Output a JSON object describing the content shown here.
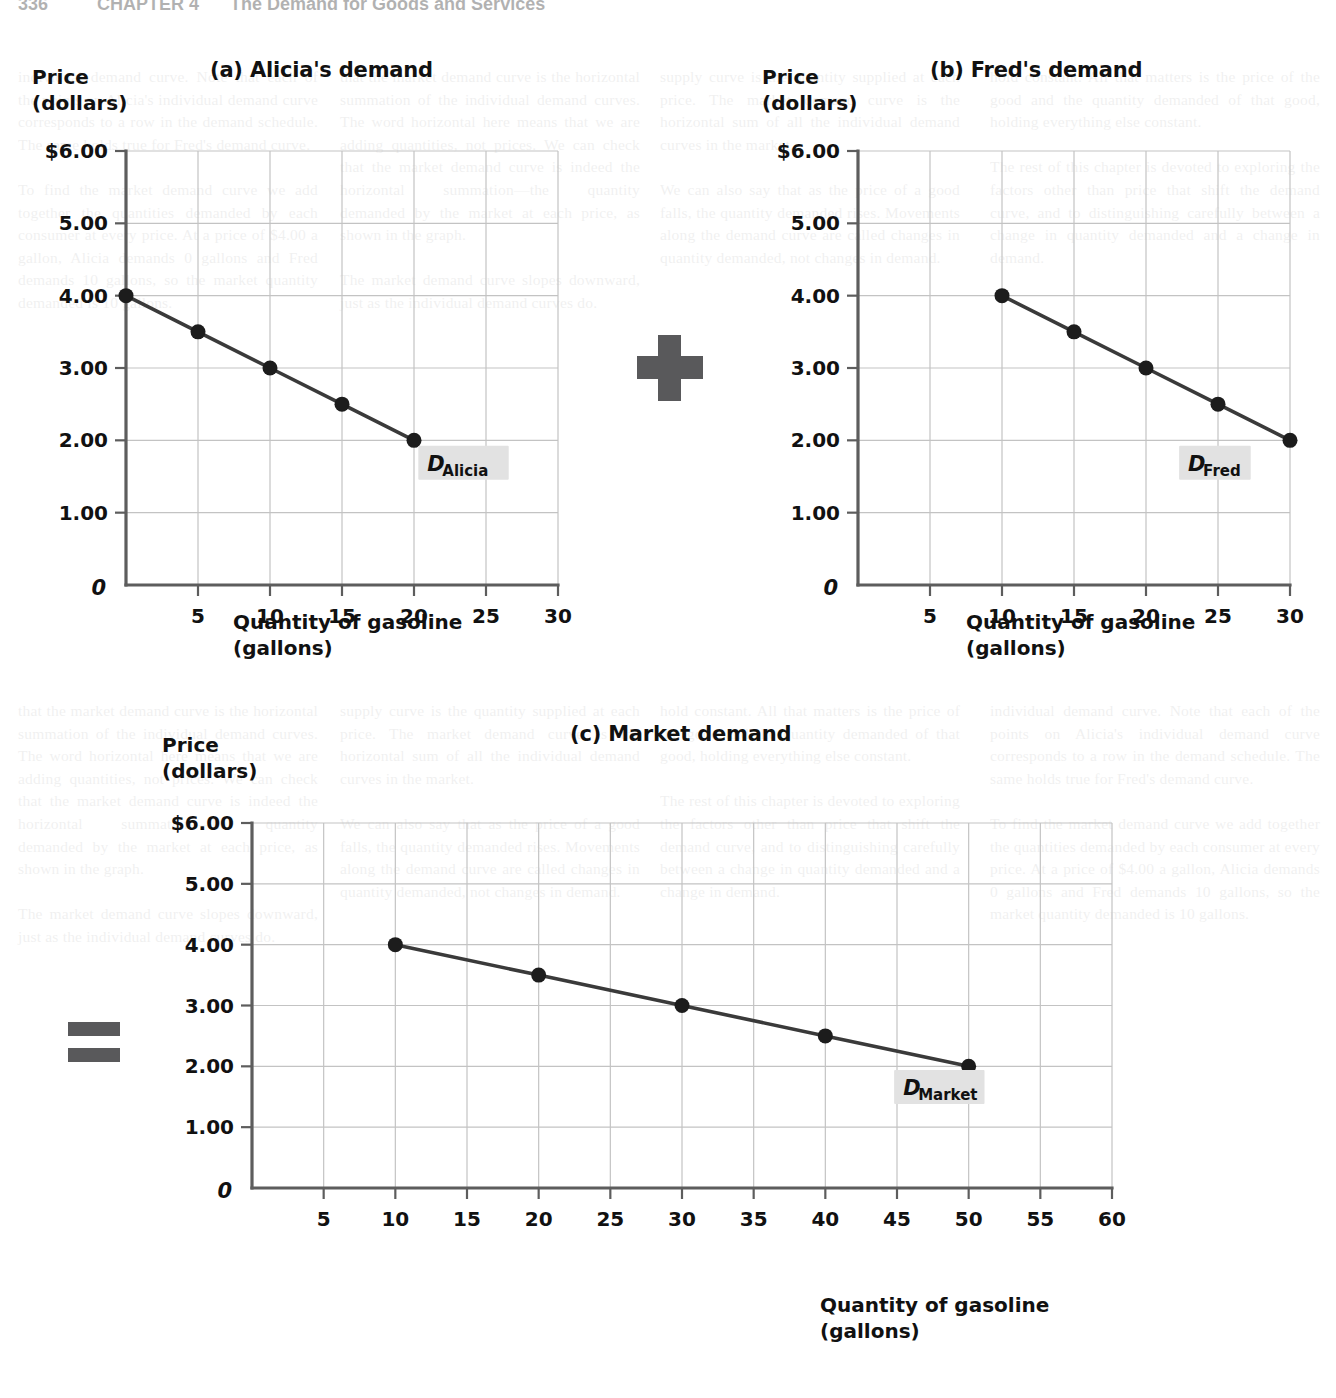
{
  "page": {
    "running_head": {
      "folio": "336",
      "chapter": "CHAPTER 4",
      "title": "The Demand for Goods and Services"
    },
    "background_text": {
      "col1": "individual demand curve. Note that each of the points on Alicia's individual demand curve corresponds to a row in the demand schedule. The same holds true for Fred's demand curve.\n\nTo find the market demand curve we add together the quantities demanded by each consumer at every price. At a price of $4.00 a gallon, Alicia demands 0 gallons and Fred demands 10 gallons, so the market quantity demanded is 10 gallons.",
      "col2": "that the market demand curve is the horizontal summation of the individual demand curves. The word horizontal here means that we are adding quantities, not prices. We can check that the market demand curve is indeed the horizontal summation—the quantity demanded by the market at each price, as shown in the graph.\n\nThe market demand curve slopes downward, just as the individual demand curves do.",
      "col3": "supply curve is the quantity supplied at each price. The market demand curve is the horizontal sum of all the individual demand curves in the market.\n\nWe can also say that as the price of a good falls, the quantity demanded rises. Movements along the demand curve are called changes in quantity demanded, not changes in demand.",
      "col4": "hold constant. All that matters is the price of the good and the quantity demanded of that good, holding everything else constant.\n\nThe rest of this chapter is devoted to exploring the factors other than price that shift the demand curve, and to distinguishing carefully between a change in quantity demanded and a change in demand."
    },
    "operators": {
      "plus": "+",
      "equals": "="
    }
  },
  "charts": {
    "y_axis_caption_line1": "Price",
    "y_axis_caption_line2": "(dollars)",
    "x_axis_caption_line1": "Quantity of gasoline",
    "x_axis_caption_line2": "(gallons)",
    "origin_label": "0",
    "y_tick_labels": [
      "$6.00",
      "5.00",
      "4.00",
      "3.00",
      "2.00",
      "1.00"
    ]
  },
  "chart_data": [
    {
      "id": "alicia",
      "type": "line",
      "title": "(a) Alicia's demand",
      "xlabel": "Quantity of gasoline (gallons)",
      "ylabel": "Price (dollars)",
      "series_label_d": "D",
      "series_label_sub": "Alicia",
      "x": [
        0,
        5,
        10,
        15,
        20
      ],
      "values": [
        4.0,
        3.5,
        3.0,
        2.5,
        2.0
      ],
      "xlim": [
        0,
        30
      ],
      "ylim": [
        0,
        6
      ],
      "xticks": [
        5,
        10,
        15,
        20,
        25,
        30
      ],
      "xtick_labels": [
        "5",
        "10",
        "15",
        "20",
        "25",
        "30"
      ],
      "yticks": [
        1,
        2,
        3,
        4,
        5,
        6
      ],
      "ytick_labels": [
        "1.00",
        "2.00",
        "3.00",
        "4.00",
        "5.00",
        "$6.00"
      ],
      "grid": true,
      "legend": "inline-curve-label"
    },
    {
      "id": "fred",
      "type": "line",
      "title": "(b) Fred's demand",
      "xlabel": "Quantity of gasoline (gallons)",
      "ylabel": "Price (dollars)",
      "series_label_d": "D",
      "series_label_sub": "Fred",
      "x": [
        10,
        15,
        20,
        25,
        30
      ],
      "values": [
        4.0,
        3.5,
        3.0,
        2.5,
        2.0
      ],
      "xlim": [
        0,
        30
      ],
      "ylim": [
        0,
        6
      ],
      "xticks": [
        5,
        10,
        15,
        20,
        25,
        30
      ],
      "xtick_labels": [
        "5",
        "10",
        "15",
        "20",
        "25",
        "30"
      ],
      "yticks": [
        1,
        2,
        3,
        4,
        5,
        6
      ],
      "ytick_labels": [
        "1.00",
        "2.00",
        "3.00",
        "4.00",
        "5.00",
        "$6.00"
      ],
      "grid": true,
      "legend": "inline-curve-label"
    },
    {
      "id": "market",
      "type": "line",
      "title": "(c) Market demand",
      "xlabel": "Quantity of gasoline (gallons)",
      "ylabel": "Price (dollars)",
      "series_label_d": "D",
      "series_label_sub": "Market",
      "x": [
        10,
        20,
        30,
        40,
        50
      ],
      "values": [
        4.0,
        3.5,
        3.0,
        2.5,
        2.0
      ],
      "xlim": [
        0,
        60
      ],
      "ylim": [
        0,
        6
      ],
      "xticks": [
        5,
        10,
        15,
        20,
        25,
        30,
        35,
        40,
        45,
        50,
        55,
        60
      ],
      "xtick_labels": [
        "5",
        "10",
        "15",
        "20",
        "25",
        "30",
        "35",
        "40",
        "45",
        "50",
        "55",
        "60"
      ],
      "yticks": [
        1,
        2,
        3,
        4,
        5,
        6
      ],
      "ytick_labels": [
        "1.00",
        "2.00",
        "3.00",
        "4.00",
        "5.00",
        "$6.00"
      ],
      "grid": true,
      "legend": "inline-curve-label"
    }
  ]
}
